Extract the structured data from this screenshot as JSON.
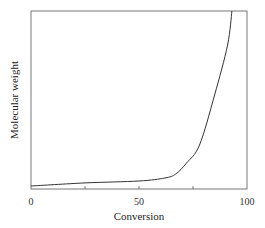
{
  "chart_data": {
    "type": "line",
    "title": "",
    "xlabel": "Conversion",
    "ylabel": "Molecular weight",
    "xlim": [
      0,
      100
    ],
    "ylim": [
      0,
      100
    ],
    "x_ticks": [
      0,
      25,
      50,
      75,
      100
    ],
    "x_tick_labels": [
      "0",
      "",
      "50",
      "",
      "100"
    ],
    "y_ticks": [],
    "grid": false,
    "legend": null,
    "series": [
      {
        "name": "Molecular weight vs conversion",
        "x": [
          0,
          25,
          50,
          62,
          67,
          72,
          78,
          85,
          91,
          93
        ],
        "y": [
          1.7,
          3.4,
          4.5,
          6.2,
          8.4,
          14.6,
          24.7,
          52.8,
          80.9,
          100
        ]
      }
    ],
    "line_color": "#333333"
  },
  "labels": {
    "x_axis": "Conversion",
    "y_axis": "Molecular weight",
    "tick_0": "0",
    "tick_50": "50",
    "tick_100": "100"
  }
}
